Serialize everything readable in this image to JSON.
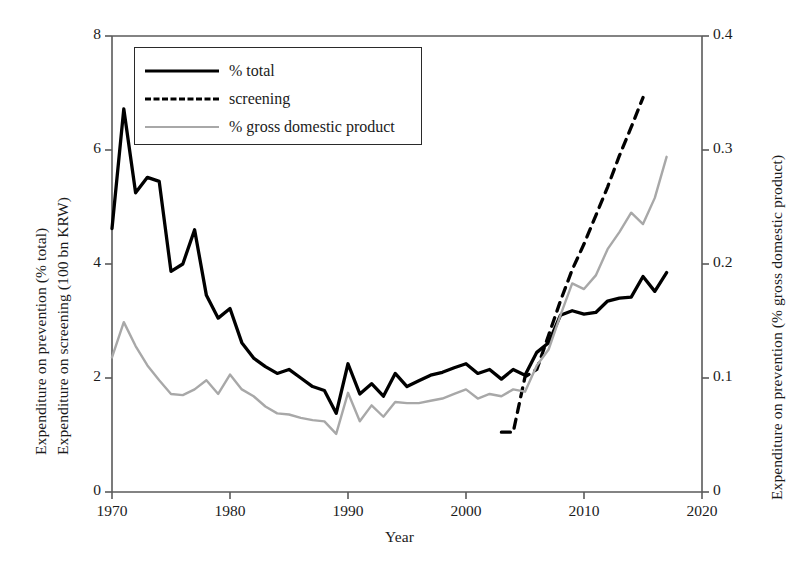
{
  "chart_data": {
    "type": "line",
    "title": "",
    "xlabel": "Year",
    "ylabel_left": "Expenditure on prevention (% total)\nExpenditure on screening (100 bn KRW)",
    "ylabel_left_line1": "Expenditure on prevention (% total)",
    "ylabel_left_line2": "Expenditure on screening (100 bn KRW)",
    "ylabel_right": "Expenditure on prevention (% gross domestic product)",
    "xlim": [
      1970,
      2020
    ],
    "ylim_left": [
      0,
      8
    ],
    "ylim_right": [
      0,
      0.4
    ],
    "xticks": [
      "1970",
      "1980",
      "1990",
      "2000",
      "2010",
      "2020"
    ],
    "xtick_values": [
      1970,
      1980,
      1990,
      2000,
      2010,
      2020
    ],
    "yticks_left": [
      "0",
      "2",
      "4",
      "6",
      "8"
    ],
    "ytick_left_values": [
      0,
      2,
      4,
      6,
      8
    ],
    "yticks_right": [
      "0",
      "0.1",
      "0.2",
      "0.3",
      "0.4"
    ],
    "ytick_right_values": [
      0,
      0.1,
      0.2,
      0.3,
      0.4
    ],
    "grid": false,
    "legend_position": "top-left",
    "colors": {
      "total": "#000000",
      "screening": "#000000",
      "gdp": "#a8a8a8",
      "axis": "#5a5a5a",
      "text": "#1b1b1b",
      "background": "#ffffff"
    },
    "series": [
      {
        "name": "% total",
        "axis": "left",
        "style": "solid",
        "color": "#000000",
        "x": [
          1970,
          1971,
          1972,
          1973,
          1974,
          1975,
          1976,
          1977,
          1978,
          1979,
          1980,
          1981,
          1982,
          1983,
          1984,
          1985,
          1986,
          1987,
          1988,
          1989,
          1990,
          1991,
          1992,
          1993,
          1994,
          1995,
          1996,
          1997,
          1998,
          1999,
          2000,
          2001,
          2002,
          2003,
          2004,
          2005,
          2006,
          2007,
          2008,
          2009,
          2010,
          2011,
          2012,
          2013,
          2014,
          2015,
          2016,
          2017
        ],
        "values": [
          4.62,
          6.72,
          5.25,
          5.52,
          5.45,
          3.87,
          4.0,
          4.6,
          3.45,
          3.05,
          3.22,
          2.62,
          2.35,
          2.2,
          2.08,
          2.15,
          2.0,
          1.85,
          1.78,
          1.38,
          2.25,
          1.72,
          1.9,
          1.68,
          2.08,
          1.85,
          1.95,
          2.05,
          2.1,
          2.18,
          2.25,
          2.08,
          2.15,
          1.98,
          2.15,
          2.05,
          2.45,
          2.62,
          3.1,
          3.18,
          3.12,
          3.15,
          3.35,
          3.4,
          3.42,
          3.78,
          3.52,
          3.85
        ]
      },
      {
        "name": "screening",
        "axis": "left",
        "style": "dashed",
        "color": "#000000",
        "x": [
          2003,
          2004,
          2005,
          2006,
          2007,
          2008,
          2009,
          2010,
          2011,
          2012,
          2013,
          2014,
          2015
        ],
        "values": [
          1.05,
          1.05,
          2.02,
          2.15,
          2.75,
          3.35,
          3.9,
          4.35,
          4.85,
          5.35,
          5.9,
          6.4,
          6.92
        ]
      },
      {
        "name": "% gross domestic product",
        "axis": "right",
        "style": "solid",
        "color": "#a8a8a8",
        "x": [
          1970,
          1971,
          1972,
          1973,
          1974,
          1975,
          1976,
          1977,
          1978,
          1979,
          1980,
          1981,
          1982,
          1983,
          1984,
          1985,
          1986,
          1987,
          1988,
          1989,
          1990,
          1991,
          1992,
          1993,
          1994,
          1995,
          1996,
          1997,
          1998,
          1999,
          2000,
          2001,
          2002,
          2003,
          2004,
          2005,
          2006,
          2007,
          2008,
          2009,
          2010,
          2011,
          2012,
          2013,
          2014,
          2015,
          2016,
          2017
        ],
        "values": [
          0.118,
          0.149,
          0.128,
          0.111,
          0.098,
          0.086,
          0.085,
          0.09,
          0.098,
          0.086,
          0.103,
          0.09,
          0.084,
          0.075,
          0.069,
          0.068,
          0.065,
          0.063,
          0.062,
          0.051,
          0.087,
          0.062,
          0.076,
          0.066,
          0.079,
          0.078,
          0.078,
          0.08,
          0.082,
          0.086,
          0.09,
          0.082,
          0.086,
          0.084,
          0.09,
          0.088,
          0.111,
          0.125,
          0.155,
          0.183,
          0.178,
          0.19,
          0.213,
          0.228,
          0.245,
          0.235,
          0.258,
          0.294
        ]
      }
    ]
  },
  "legend": {
    "items": [
      {
        "label": "% total",
        "style": "solid",
        "color": "#000000"
      },
      {
        "label": "screening",
        "style": "dashed",
        "color": "#000000"
      },
      {
        "label": "% gross domestic product",
        "style": "gray",
        "color": "#a8a8a8"
      }
    ]
  }
}
